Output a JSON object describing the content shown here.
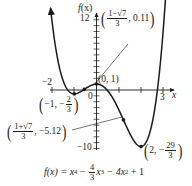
{
  "chart_data": {
    "type": "line",
    "function": "f(x) = x^4 - (4/3)x^3 - 4x^2 + 1",
    "xlabel": "x",
    "ylabel": "f(x)",
    "x_ticks_labeled": [
      -2,
      3
    ],
    "y_ticks_labeled": [
      12,
      -10
    ],
    "origin_label": "0",
    "xlim": [
      -2.1,
      3.3
    ],
    "ylim": [
      -10,
      12
    ],
    "grid": false,
    "points": [
      {
        "label": "(1-√7)/3, 0.11",
        "x": -0.5486,
        "y": 0.11,
        "type": "local max (inflection annotated)"
      },
      {
        "label": "(0, 1)",
        "x": 0,
        "y": 1,
        "type": "local max"
      },
      {
        "label": "(-1, -2/3)",
        "x": -1,
        "y": -0.6667,
        "type": "local min"
      },
      {
        "label": "(1+√7)/3, -5.12",
        "x": 1.2153,
        "y": -5.12,
        "type": "inflection"
      },
      {
        "label": "(2, -29/3)",
        "x": 2,
        "y": -9.6667,
        "type": "local min"
      }
    ],
    "colors": {
      "curve": "#1a1a1a",
      "axes": "#1a1a1a"
    }
  },
  "axes": {
    "y_label_f": "f",
    "y_label_x": "(x)",
    "y_tick_top": "12",
    "y_tick_bottom": "−10",
    "x_tick_left": "−2",
    "x_tick_right": "3",
    "x_label": "x",
    "origin": "0"
  },
  "annotations": {
    "top_frac_num": "1−√7",
    "top_frac_den": "3",
    "top_val": ", 0.11",
    "origin_pt": "(0, 1)",
    "left_min_pre": "−1, −",
    "left_min_num": "2",
    "left_min_den": "3",
    "bottom_frac_num": "1+√7",
    "bottom_frac_den": "3",
    "bottom_val": ", −5.12",
    "right_min_pre": "2, −",
    "right_min_num": "29",
    "right_min_den": "3"
  },
  "equation": {
    "lhs": "f(x) = x",
    "exp4": "4",
    "minus1": " − ",
    "frac_num": "4",
    "frac_den": "3",
    "x3": "x",
    "exp3": "3",
    "mid": " − 4x",
    "exp2": "2",
    "tail": " + 1"
  }
}
